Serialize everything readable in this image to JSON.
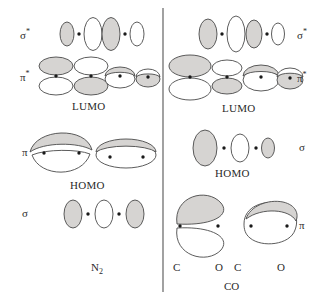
{
  "figure": {
    "title_left": "N2",
    "title_right": "CO",
    "divider": "vertical-rule",
    "colors": {
      "lobe_shaded": "#d6d4d2",
      "lobe_empty": "#ffffff",
      "outline": "#4a4a4a",
      "nucleus_dot": "#1a1a1a",
      "text": "#2a2a2a",
      "divider": "#555555",
      "background": "#ffffff"
    }
  },
  "left_panel": {
    "molecule": "N2",
    "molecule_label": "N",
    "molecule_sub": "2",
    "row_labels": {
      "sigma_star": "σ",
      "sigma_star_sup": "*",
      "pi_star": "π",
      "pi_star_sup": "*",
      "pi": "π",
      "sigma": "σ"
    },
    "markers": {
      "lumo": "LUMO",
      "homo": "HOMO"
    },
    "rows": [
      {
        "id": "sigma-star",
        "label": "σ*",
        "type": "sigma-antibonding",
        "description": "four vertical ellipses alternating shaded and empty with two nuclei dots"
      },
      {
        "id": "pi-star",
        "label": "π*",
        "type": "pi-antibonding",
        "description": "two stacked ellipse pairs and two tilted disk pairs, nuclei dots at waist"
      },
      {
        "id": "pi",
        "label": "π",
        "type": "pi-bonding",
        "description": "lens shaped shaded upper lobe over empty lower lobe, and a flattened shaded disk"
      },
      {
        "id": "sigma",
        "label": "σ",
        "type": "sigma-bonding",
        "description": "shaded ellipse, dot, empty ellipse, dot, shaded ellipse"
      }
    ]
  },
  "right_panel": {
    "molecule": "CO",
    "molecule_label": "CO",
    "atom_labels": [
      "C",
      "O",
      "C",
      "O"
    ],
    "row_labels": {
      "sigma_star": "σ",
      "sigma_star_sup": "*",
      "pi_star": "π",
      "pi_star_sup": "*",
      "sigma": "σ",
      "pi": "π"
    },
    "markers": {
      "lumo": "LUMO",
      "homo": "HOMO"
    },
    "rows": [
      {
        "id": "sigma-star",
        "label": "σ*",
        "type": "sigma-antibonding",
        "description": "shaded ellipse, dot, tall empty ellipse, shaded ellipse, dot, small empty ellipse"
      },
      {
        "id": "pi-star",
        "label": "π*",
        "type": "pi-antibonding",
        "description": "large shaded over empty pair, smaller empty over shaded pair, and two tilted disks"
      },
      {
        "id": "sigma",
        "label": "σ",
        "type": "sigma-bonding-homo",
        "description": "large shaded ellipse, dot, medium empty ellipse, dot, small shaded ellipse"
      },
      {
        "id": "pi",
        "label": "π",
        "type": "pi-bonding",
        "description": "teardrop shaded upper lobe over empty lower lobe, and a rounded blob"
      }
    ]
  }
}
